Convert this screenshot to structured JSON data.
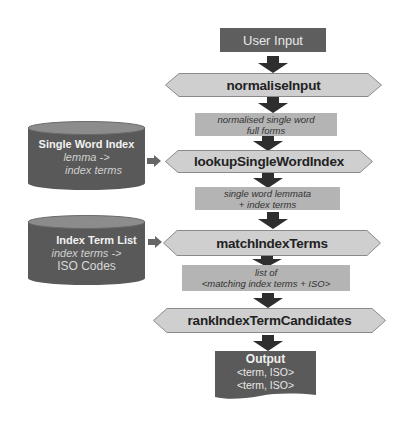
{
  "diagram": {
    "start": {
      "label": "User Input"
    },
    "processes": [
      {
        "label": "normaliseInput"
      },
      {
        "label": "lookupSingleWordIndex"
      },
      {
        "label": "matchIndexTerms"
      },
      {
        "label": "rankIndexTermCandidates"
      }
    ],
    "data_flows": [
      {
        "line1": "normalised single word",
        "line2": "full forms"
      },
      {
        "line1": "single word lemmata",
        "line2": "+ index terms"
      },
      {
        "line1": "list of",
        "line2": "<matching index terms + ISO>"
      }
    ],
    "data_stores": [
      {
        "title": "Single Word Index",
        "line1": "lemma ->",
        "line2": "index terms"
      },
      {
        "title": "Index Term List",
        "line1": "index terms ->",
        "line2": "ISO Codes"
      }
    ],
    "output": {
      "title": "Output",
      "line1": "<term, ISO>",
      "line2": "<term, ISO>"
    },
    "colors": {
      "terminal": "#5e5e5e",
      "process_fill": "#cfcfcf",
      "data_fill": "#b4b4b4",
      "store_body": "#595959",
      "store_top": "#8c8c8c",
      "arrow": "#2e2e2e"
    }
  }
}
